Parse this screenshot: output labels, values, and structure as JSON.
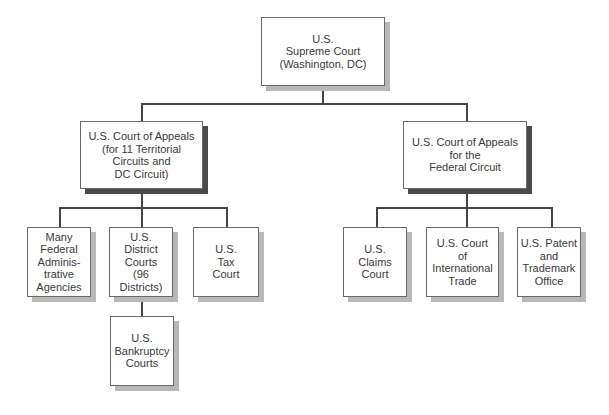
{
  "diagram": {
    "type": "org-chart",
    "nodes": {
      "supreme": {
        "label": "U.S.\nSupreme Court\n(Washington, DC)"
      },
      "appeals_territorial": {
        "label": "U.S. Court of Appeals\n(for 11 Territorial\nCircuits and\nDC Circuit)"
      },
      "appeals_federal": {
        "label": "U.S. Court of Appeals\nfor the\nFederal Circuit"
      },
      "admin_agencies": {
        "label": "Many\nFederal\nAdminis-\ntrative\nAgencies"
      },
      "district_courts": {
        "label": "U.S.\nDistrict\nCourts\n(96\nDistricts)"
      },
      "tax_court": {
        "label": "U.S.\nTax\nCourt"
      },
      "bankruptcy_courts": {
        "label": "U.S.\nBankruptcy\nCourts"
      },
      "claims_court": {
        "label": "U.S.\nClaims\nCourt"
      },
      "international_trade": {
        "label": "U.S. Court\nof\nInternational\nTrade"
      },
      "patent_office": {
        "label": "U.S. Patent\nand\nTrademark\nOffice"
      }
    },
    "edges": [
      [
        "supreme",
        "appeals_territorial"
      ],
      [
        "supreme",
        "appeals_federal"
      ],
      [
        "appeals_territorial",
        "admin_agencies"
      ],
      [
        "appeals_territorial",
        "district_courts"
      ],
      [
        "appeals_territorial",
        "tax_court"
      ],
      [
        "district_courts",
        "bankruptcy_courts"
      ],
      [
        "appeals_federal",
        "claims_court"
      ],
      [
        "appeals_federal",
        "international_trade"
      ],
      [
        "appeals_federal",
        "patent_office"
      ]
    ]
  }
}
